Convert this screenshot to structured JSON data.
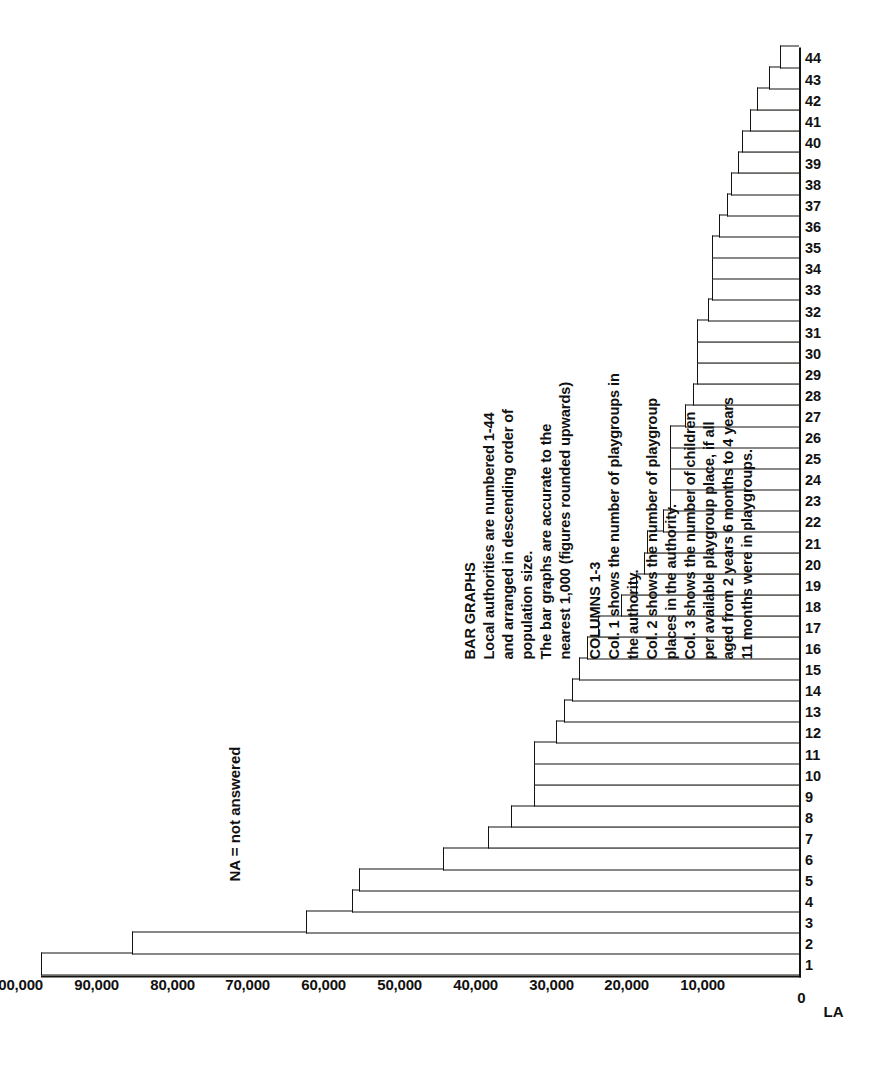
{
  "figure": {
    "la_axis_label": "LA",
    "zero_label": "0",
    "na_note": "NA = not answered"
  },
  "notes": {
    "heading_1": "BAR GRAPHS",
    "lines_1": [
      "Local authorities are numbered 1-44",
      "and arranged in descending order of",
      "population size.",
      "The bar graphs are accurate to the",
      "nearest 1,000 (figures rounded upwards)"
    ],
    "heading_2": "COLUMNS 1-3",
    "lines_2": [
      "Col. 1 shows the number of playgroups in",
      "the authority.",
      "Col. 2 shows the number of playgroup",
      "places in the authority.",
      "Col. 3 shows the number of children",
      "per available playgroup place, if all",
      "aged from 2 years 6 months to 4 years",
      "11 months were in playgroups."
    ]
  },
  "chart_data": {
    "type": "bar",
    "title": "",
    "xlabel": "LA",
    "ylabel": "",
    "ylim": [
      0,
      100000
    ],
    "ytick_values": [
      0,
      10000,
      20000,
      30000,
      40000,
      50000,
      60000,
      70000,
      80000,
      90000,
      100000
    ],
    "ytick_labels": [
      "0",
      "10,000",
      "20,000",
      "30,000",
      "40,000",
      "50,000",
      "60,000",
      "70,000",
      "80,000",
      "90,000",
      "100,000"
    ],
    "grid": false,
    "legend": "none",
    "orientation": "vertical-bars-printed-sideways",
    "categories": [
      "1",
      "2",
      "3",
      "4",
      "5",
      "6",
      "7",
      "8",
      "9",
      "10",
      "11",
      "12",
      "13",
      "14",
      "15",
      "16",
      "17",
      "18",
      "19",
      "20",
      "21",
      "22",
      "23",
      "24",
      "25",
      "26",
      "27",
      "28",
      "29",
      "30",
      "31",
      "32",
      "33",
      "34",
      "35",
      "36",
      "37",
      "38",
      "39",
      "40",
      "41",
      "42",
      "43",
      "44"
    ],
    "values": [
      100000,
      88000,
      65000,
      59000,
      58000,
      47000,
      41000,
      38000,
      35000,
      35000,
      35000,
      32000,
      31000,
      30000,
      29000,
      28000,
      26500,
      23500,
      21500,
      20500,
      20000,
      18000,
      17000,
      17000,
      17000,
      17000,
      15000,
      14000,
      13500,
      13500,
      13500,
      12000,
      11500,
      11500,
      11500,
      10500,
      9500,
      9000,
      8000,
      7500,
      6500,
      5500,
      4000,
      2500
    ],
    "units": "population",
    "note": "NA = not answered"
  }
}
